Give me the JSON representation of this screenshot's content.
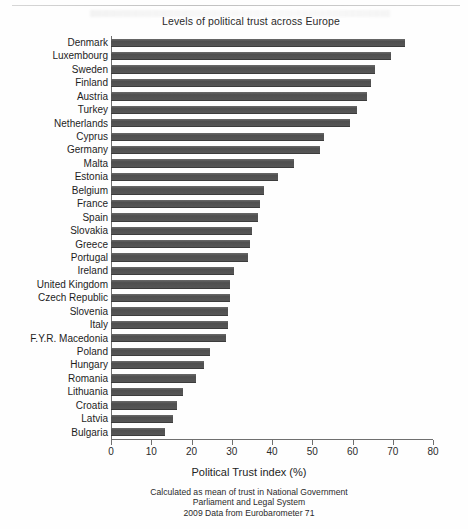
{
  "chart_data": {
    "type": "bar",
    "orientation": "horizontal",
    "title": "Levels of political trust across Europe",
    "xlabel": "Political Trust index (%)",
    "ylabel": "",
    "xlim": [
      0,
      80
    ],
    "xticks": [
      0,
      10,
      20,
      30,
      40,
      50,
      60,
      70,
      80
    ],
    "grid": false,
    "legend": null,
    "categories": [
      "Denmark",
      "Luxembourg",
      "Sweden",
      "Finland",
      "Austria",
      "Turkey",
      "Netherlands",
      "Cyprus",
      "Germany",
      "Malta",
      "Estonia",
      "Belgium",
      "France",
      "Spain",
      "Slovakia",
      "Greece",
      "Portugal",
      "Ireland",
      "United Kingdom",
      "Czech Republic",
      "Slovenia",
      "Italy",
      "F.Y.R. Macedonia",
      "Poland",
      "Hungary",
      "Romania",
      "Lithuania",
      "Croatia",
      "Latvia",
      "Bulgaria"
    ],
    "values": [
      73,
      69.5,
      65.5,
      64.5,
      63.5,
      61,
      59.5,
      53,
      52,
      45.5,
      41.5,
      38,
      37,
      36.5,
      35,
      34.5,
      34,
      30.5,
      29.5,
      29.5,
      29,
      29,
      28.5,
      24.5,
      23,
      21,
      18,
      16.5,
      15.5,
      13.5
    ],
    "notes": [
      "Calculated as mean of trust in National Government",
      "Parliament and Legal System",
      "2009 Data from Eurobarometer 71"
    ],
    "bar_color": "#565656",
    "axis_color": "#6f6f6f"
  }
}
